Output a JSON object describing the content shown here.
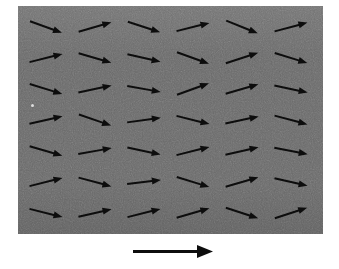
{
  "figure": {
    "kind": "vector-field-diagram",
    "background_color": "#ffffff",
    "caption": ""
  },
  "panel": {
    "name": "vector-field-panel",
    "x": 18,
    "y": 6,
    "width": 305,
    "height": 228,
    "fill_color": "#6a6a6a",
    "texture": "grainy-noise",
    "border": "none"
  },
  "speck": {
    "name": "dust-speck",
    "x": 31,
    "y": 104,
    "size": 3,
    "color": "#e8e8e8"
  },
  "arrow_style": {
    "color": "#0d0d0d",
    "shaft_width": 2.0,
    "head_length": 9,
    "head_width": 7,
    "length": 34
  },
  "grid": {
    "rows": 7,
    "cols": 6,
    "x_start": 46,
    "x_step": 49,
    "y_start": 27,
    "y_step": 31
  },
  "chart_data": {
    "type": "quiver",
    "title": "",
    "xlabel": "",
    "ylabel": "",
    "units": "arbitrary",
    "rows": 7,
    "cols": 6,
    "angles_deg": [
      [
        20,
        -16,
        18,
        -14,
        22,
        -15
      ],
      [
        -14,
        16,
        13,
        20,
        -18,
        17
      ],
      [
        17,
        -12,
        10,
        -20,
        -16,
        12
      ],
      [
        -13,
        19,
        -8,
        14,
        -12,
        15
      ],
      [
        16,
        -10,
        12,
        -14,
        -13,
        11
      ],
      [
        -14,
        15,
        -7,
        17,
        -16,
        13
      ],
      [
        14,
        -13,
        -14,
        -16,
        18,
        -18
      ]
    ],
    "magnitudes": [
      [
        1,
        1,
        1,
        1,
        1,
        1
      ],
      [
        1,
        1,
        1,
        1,
        1,
        1
      ],
      [
        1,
        1,
        1,
        1,
        1,
        1
      ],
      [
        1,
        1,
        1,
        1,
        1,
        1
      ],
      [
        1,
        1,
        1,
        1,
        1,
        1
      ],
      [
        1,
        1,
        1,
        1,
        1,
        1
      ],
      [
        1,
        1,
        1,
        1,
        1,
        1
      ]
    ],
    "legend": {
      "position": "below-panel",
      "label": "",
      "reference_vector_angle_deg": 0,
      "reference_vector_length_px": 80
    }
  },
  "scale_arrow": {
    "name": "scale-reference-arrow",
    "x": 133,
    "y": 251,
    "length": 80,
    "angle_deg": 0,
    "shaft_width": 3,
    "head_length": 16,
    "head_width": 13,
    "color": "#0d0d0d",
    "label": ""
  }
}
